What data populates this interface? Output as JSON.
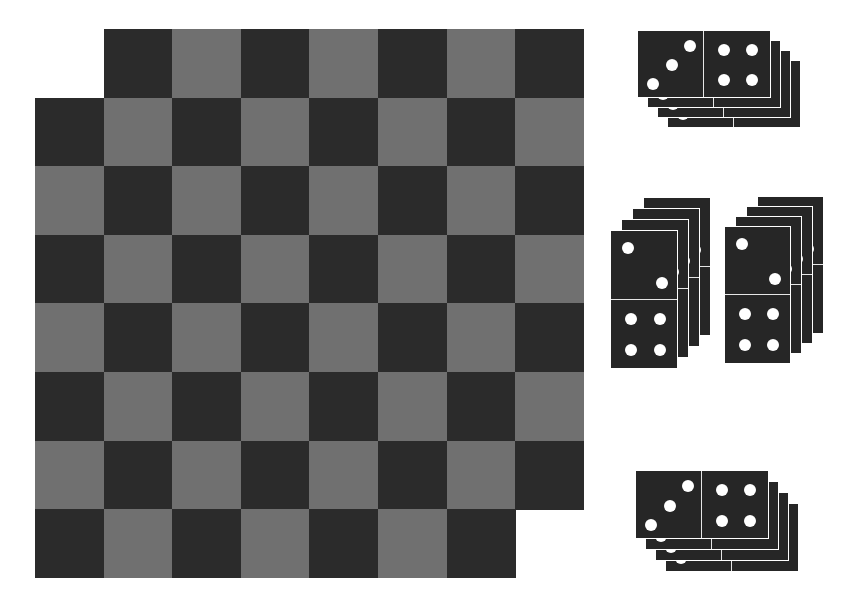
{
  "board": {
    "cell_size": 68.6,
    "origin_x": 35,
    "origin_y": 29,
    "colors": {
      "light": "#707070",
      "dark": "#2b2b2b"
    },
    "rows": [
      {
        "start_col": 1,
        "end_col": 7
      },
      {
        "start_col": 0,
        "end_col": 7
      },
      {
        "start_col": 0,
        "end_col": 7
      },
      {
        "start_col": 0,
        "end_col": 7
      },
      {
        "start_col": 0,
        "end_col": 7
      },
      {
        "start_col": 0,
        "end_col": 7
      },
      {
        "start_col": 0,
        "end_col": 7
      },
      {
        "start_col": 0,
        "end_col": 6
      }
    ]
  },
  "domino_stacks": [
    {
      "name": "top-stack",
      "orientation": "h",
      "x": 637,
      "y": 30,
      "w": 134,
      "h": 68,
      "count": 4,
      "dx": 10,
      "dy": 10,
      "pips_a": 3,
      "pips_b": 4
    },
    {
      "name": "left-stack",
      "orientation": "v",
      "x": 610,
      "y": 230,
      "w": 68,
      "h": 139,
      "count": 4,
      "dx": 11,
      "dy": -11,
      "pips_a": 2,
      "pips_b": 4
    },
    {
      "name": "right-stack",
      "orientation": "v",
      "x": 724,
      "y": 226,
      "w": 67,
      "h": 138,
      "count": 4,
      "dx": 11,
      "dy": -10,
      "pips_a": 2,
      "pips_b": 4
    },
    {
      "name": "bottom-stack",
      "orientation": "h",
      "x": 635,
      "y": 470,
      "w": 134,
      "h": 69,
      "count": 4,
      "dx": 10,
      "dy": 11,
      "pips_a": 3,
      "pips_b": 4
    }
  ]
}
